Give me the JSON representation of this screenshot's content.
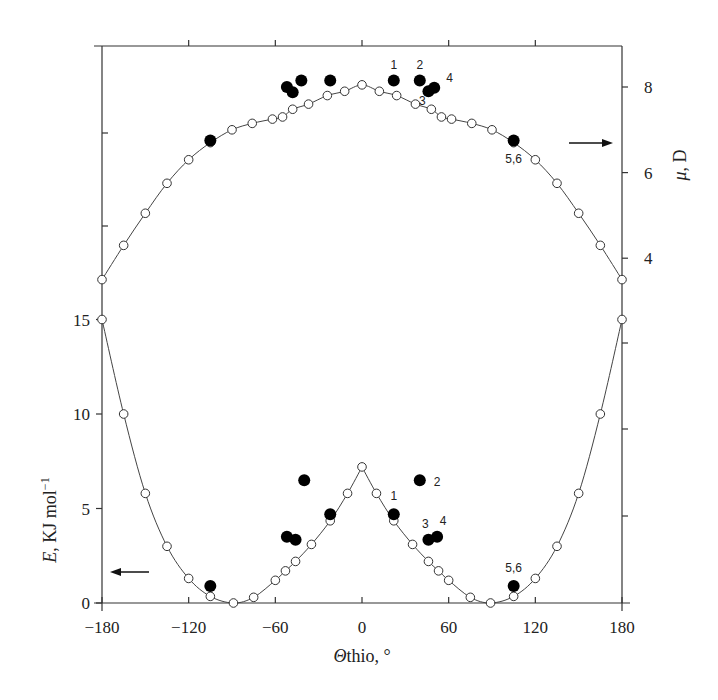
{
  "chart_data": {
    "type": "line",
    "title": "",
    "xlabel": "Θthio, °",
    "ylabel_left": "E, KJ mol⁻¹",
    "ylabel_right": "μ, D",
    "xlim": [
      -180,
      180
    ],
    "ylim_left": [
      0,
      29.5
    ],
    "ylim_right": [
      1.0,
      8.95
    ],
    "x_ticks": [
      -180,
      -120,
      -60,
      0,
      60,
      120,
      180
    ],
    "y_ticks_left": [
      0,
      5,
      10,
      15
    ],
    "y_ticks_right": [
      4,
      6,
      8
    ],
    "grid": false,
    "legend": "none",
    "axis_arrows": [
      {
        "direction": "left",
        "meaning": "energy curve reads on left axis"
      },
      {
        "direction": "right",
        "meaning": "dipole curve reads on right axis"
      }
    ],
    "series": [
      {
        "name": "E (calculated)",
        "axis": "left",
        "marker": "open-circle",
        "line": true,
        "x": [
          -180,
          -165,
          -150,
          -135,
          -120,
          -105,
          -89,
          -75,
          -60,
          -53,
          -46,
          -35,
          -22,
          -10,
          0,
          10,
          22,
          35,
          46,
          53,
          60,
          75,
          89,
          105,
          120,
          135,
          150,
          165,
          180
        ],
        "y": [
          15.0,
          10.0,
          5.8,
          3.0,
          1.3,
          0.35,
          0.0,
          0.3,
          1.2,
          1.7,
          2.2,
          3.1,
          4.35,
          5.8,
          7.2,
          5.8,
          4.35,
          3.1,
          2.2,
          1.7,
          1.2,
          0.3,
          0.0,
          0.35,
          1.3,
          3.0,
          5.8,
          10.0,
          15.0
        ]
      },
      {
        "name": "μ (calculated)",
        "axis": "right",
        "marker": "open-circle",
        "line": true,
        "x": [
          -180,
          -165,
          -150,
          -135,
          -120,
          -105,
          -90,
          -76,
          -62,
          -55,
          -48,
          -37,
          -24,
          -12,
          0,
          12,
          24,
          37,
          48,
          55,
          62,
          76,
          90,
          105,
          120,
          135,
          150,
          165,
          180
        ],
        "y": [
          3.5,
          4.3,
          5.05,
          5.75,
          6.3,
          6.7,
          7.0,
          7.15,
          7.25,
          7.3,
          7.48,
          7.6,
          7.8,
          7.9,
          8.05,
          7.9,
          7.8,
          7.6,
          7.48,
          7.3,
          7.25,
          7.15,
          7.0,
          6.7,
          6.3,
          5.75,
          5.05,
          4.3,
          3.5
        ]
      },
      {
        "name": "E (compounds)",
        "axis": "left",
        "marker": "filled-circle",
        "line": false,
        "x": [
          -105,
          -52,
          -46,
          -40,
          -22,
          22,
          40,
          46,
          52,
          105
        ],
        "y": [
          0.9,
          3.5,
          3.35,
          6.5,
          4.7,
          4.7,
          6.5,
          3.35,
          3.5,
          0.9
        ],
        "labels": [
          "",
          "",
          "",
          "",
          "",
          "1",
          "2",
          "3",
          "4",
          "5,6"
        ]
      },
      {
        "name": "μ (compounds)",
        "axis": "right",
        "marker": "filled-circle",
        "line": false,
        "x": [
          -105,
          -52,
          -48,
          -42,
          -22,
          22,
          40,
          46,
          50,
          105
        ],
        "y": [
          6.75,
          8.0,
          7.88,
          8.15,
          8.15,
          8.15,
          8.15,
          7.9,
          7.98,
          6.75
        ],
        "labels": [
          "",
          "",
          "",
          "",
          "",
          "1",
          "2",
          "3",
          "4",
          "5,6"
        ]
      }
    ]
  },
  "labels": {
    "x_axis_title": "Θthio, °",
    "left_axis_title": "E, KJ mol⁻¹",
    "right_axis_title": "μ, D"
  }
}
